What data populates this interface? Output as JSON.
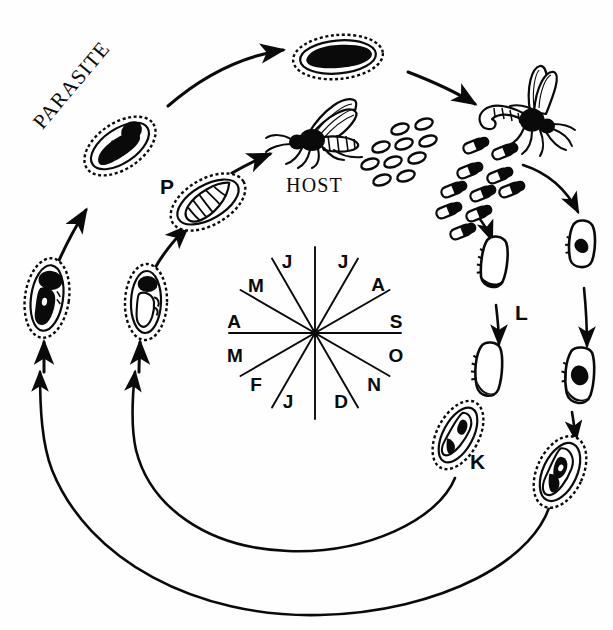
{
  "diagram": {
    "background_color": "#fefefe",
    "ink_color": "#0a0a0a",
    "labels": {
      "parasite": "PARASITE",
      "host": "HOST",
      "stage_p": "P",
      "stage_l": "L",
      "stage_k": "K"
    },
    "calendar": {
      "center_x": 315,
      "center_y": 333,
      "radius": 86,
      "spoke_count": 12,
      "months": [
        {
          "letter": "J",
          "label_x": 287,
          "label_y": 262
        },
        {
          "letter": "J",
          "label_x": 343,
          "label_y": 262
        },
        {
          "letter": "A",
          "label_x": 378,
          "label_y": 285
        },
        {
          "letter": "S",
          "label_x": 396,
          "label_y": 322
        },
        {
          "letter": "O",
          "label_x": 396,
          "label_y": 356
        },
        {
          "letter": "N",
          "label_x": 374,
          "label_y": 385
        },
        {
          "letter": "D",
          "label_x": 341,
          "label_y": 402
        },
        {
          "letter": "J",
          "label_x": 288,
          "label_y": 402
        },
        {
          "letter": "F",
          "label_x": 256,
          "label_y": 385
        },
        {
          "letter": "M",
          "label_x": 235,
          "label_y": 356
        },
        {
          "letter": "A",
          "label_x": 234,
          "label_y": 322
        },
        {
          "letter": "M",
          "label_x": 256,
          "label_y": 286
        }
      ]
    },
    "label_positions": {
      "parasite": {
        "x": 74,
        "y": 160,
        "rotate": -52
      },
      "host": {
        "x": 288,
        "y": 182
      },
      "stage_p": {
        "x": 163,
        "y": 183
      },
      "stage_l": {
        "x": 518,
        "y": 302
      },
      "stage_k": {
        "x": 473,
        "y": 459
      }
    },
    "figures": [
      {
        "name": "cocoon-top",
        "kind": "cocoon-filled",
        "x": 338,
        "y": 57,
        "w": 86,
        "h": 42,
        "rotate": -5
      },
      {
        "name": "cocoon-parasite-emerging",
        "kind": "cocoon-filled",
        "x": 120,
        "y": 144,
        "w": 70,
        "h": 42,
        "rotate": -34
      },
      {
        "name": "cocoon-pupa-p",
        "kind": "cocoon-pupa",
        "x": 208,
        "y": 200,
        "w": 72,
        "h": 42,
        "rotate": -30
      },
      {
        "name": "cocoon-left-lower",
        "kind": "cocoon-filled",
        "x": 47,
        "y": 296,
        "w": 40,
        "h": 72,
        "rotate": 8
      },
      {
        "name": "cocoon-left-mid",
        "kind": "cocoon-outline",
        "x": 146,
        "y": 300,
        "w": 38,
        "h": 70,
        "rotate": 2
      },
      {
        "name": "host-fly",
        "kind": "fly",
        "x": 310,
        "y": 140,
        "w": 86,
        "h": 62,
        "rotate": 0
      },
      {
        "name": "parasite-fly",
        "kind": "fly-ovipositing",
        "x": 515,
        "y": 112,
        "w": 90,
        "h": 72,
        "rotate": 12
      },
      {
        "name": "egg-cluster",
        "kind": "eggs",
        "x": 400,
        "y": 150,
        "w": 80,
        "h": 58,
        "rotate": 0
      },
      {
        "name": "larva-cluster",
        "kind": "larvae",
        "x": 470,
        "y": 160,
        "w": 90,
        "h": 80,
        "rotate": 0
      },
      {
        "name": "larva-l-upper",
        "kind": "larva",
        "x": 490,
        "y": 263,
        "w": 22,
        "h": 46,
        "rotate": 10
      },
      {
        "name": "larva-l-lower",
        "kind": "larva",
        "x": 485,
        "y": 370,
        "w": 22,
        "h": 48,
        "rotate": 6
      },
      {
        "name": "cocoon-k",
        "kind": "cocoon-outline",
        "x": 455,
        "y": 433,
        "w": 40,
        "h": 66,
        "rotate": 28
      },
      {
        "name": "larva-r-upper",
        "kind": "larva",
        "x": 578,
        "y": 245,
        "w": 22,
        "h": 44,
        "rotate": 6
      },
      {
        "name": "larva-r-lower",
        "kind": "larva",
        "x": 576,
        "y": 375,
        "w": 24,
        "h": 50,
        "rotate": 6
      },
      {
        "name": "cocoon-r-bottom",
        "kind": "cocoon-filled",
        "x": 558,
        "y": 470,
        "w": 42,
        "h": 68,
        "rotate": 25
      }
    ],
    "arrows": [
      {
        "name": "arrow-to-top-cocoon",
        "from": "parasite-arc",
        "type": "arc"
      },
      {
        "name": "arrow-top-to-fly",
        "type": "arc"
      },
      {
        "name": "arrow-parasite-to-fly",
        "type": "short"
      },
      {
        "name": "arrow-p-to-host",
        "type": "short"
      },
      {
        "name": "arrow-up-left-inner",
        "type": "short"
      },
      {
        "name": "arrow-up-left-outer",
        "type": "short"
      },
      {
        "name": "arrow-eggs-down",
        "type": "short"
      },
      {
        "name": "arrow-l-down",
        "type": "short"
      },
      {
        "name": "arrow-fly-to-right",
        "type": "arc"
      },
      {
        "name": "arrow-right-down",
        "type": "short"
      },
      {
        "name": "arrow-k-down",
        "type": "short"
      },
      {
        "name": "arc-inner-return",
        "type": "big-arc"
      },
      {
        "name": "arc-outer-return",
        "type": "big-arc"
      }
    ]
  }
}
